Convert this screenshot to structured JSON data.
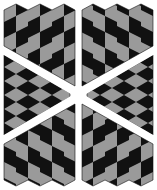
{
  "figure": {
    "width": 157,
    "height": 190,
    "colors": {
      "background": "#ffffff",
      "dark": "#111111",
      "light": "#9a9a9a",
      "separator": "#ffffff"
    },
    "panels": [
      {
        "name": "left-panel",
        "x": 4,
        "width": 71
      },
      {
        "name": "right-panel",
        "x": 82,
        "width": 71
      }
    ],
    "regions": [
      "top-left-columns",
      "top-right-columns",
      "middle-left-diamonds",
      "middle-right-diamonds",
      "bottom-left-columns",
      "bottom-right-columns"
    ],
    "center": {
      "x": 78,
      "y": 95
    }
  }
}
